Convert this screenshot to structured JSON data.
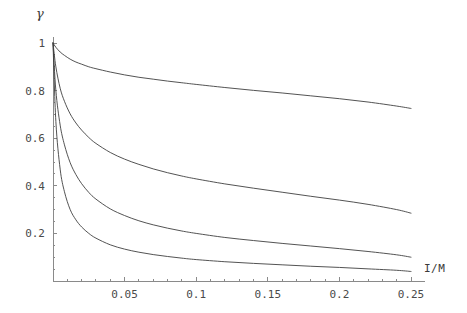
{
  "chart_data": {
    "type": "line",
    "title": "",
    "subtitle": "",
    "xlabel": "I/M",
    "ylabel": "γ",
    "xlim": [
      0,
      0.25
    ],
    "ylim": [
      0,
      1
    ],
    "grid": false,
    "legend": "none",
    "xticks": [
      0.05,
      0.1,
      0.15,
      0.2,
      0.25
    ],
    "xticklabels": [
      "0.05",
      "0.1",
      "0.15",
      "0.2",
      "0.25"
    ],
    "yticks": [
      0.2,
      0.4,
      0.6,
      0.8,
      1
    ],
    "yticklabels": [
      "0.2",
      "0.4",
      "0.6",
      "0.8",
      "1"
    ],
    "x_minor_ticks": [
      0.01,
      0.02,
      0.03,
      0.04,
      0.06,
      0.07,
      0.08,
      0.09,
      0.11,
      0.12,
      0.13,
      0.14,
      0.16,
      0.17,
      0.18,
      0.19,
      0.21,
      0.22,
      0.23,
      0.24
    ],
    "y_minor_ticks": [
      0.05,
      0.1,
      0.15,
      0.25,
      0.3,
      0.35,
      0.45,
      0.5,
      0.55,
      0.65,
      0.7,
      0.75,
      0.85,
      0.9,
      0.95
    ],
    "line_color": "#404040",
    "axis_color": "#8a8a8a",
    "background": "#ffffff",
    "series": [
      {
        "name": "curve-1",
        "x": [
          0.0,
          0.002,
          0.005,
          0.008,
          0.012,
          0.016,
          0.02,
          0.025,
          0.03,
          0.04,
          0.05,
          0.06,
          0.07,
          0.08,
          0.09,
          0.1,
          0.12,
          0.14,
          0.16,
          0.18,
          0.2,
          0.22,
          0.24,
          0.25
        ],
        "y": [
          1.0,
          0.982,
          0.962,
          0.948,
          0.932,
          0.92,
          0.911,
          0.9,
          0.892,
          0.878,
          0.866,
          0.856,
          0.848,
          0.84,
          0.833,
          0.826,
          0.813,
          0.801,
          0.79,
          0.778,
          0.766,
          0.752,
          0.735,
          0.725
        ]
      },
      {
        "name": "curve-2",
        "x": [
          0.0,
          0.002,
          0.005,
          0.008,
          0.012,
          0.016,
          0.02,
          0.025,
          0.03,
          0.04,
          0.05,
          0.06,
          0.07,
          0.08,
          0.09,
          0.1,
          0.12,
          0.14,
          0.16,
          0.18,
          0.2,
          0.22,
          0.24,
          0.25
        ],
        "y": [
          1.0,
          0.9,
          0.81,
          0.755,
          0.702,
          0.664,
          0.634,
          0.603,
          0.578,
          0.54,
          0.512,
          0.49,
          0.471,
          0.455,
          0.441,
          0.429,
          0.408,
          0.39,
          0.373,
          0.356,
          0.34,
          0.322,
          0.3,
          0.285
        ]
      },
      {
        "name": "curve-3",
        "x": [
          0.0,
          0.002,
          0.005,
          0.008,
          0.012,
          0.016,
          0.02,
          0.025,
          0.03,
          0.04,
          0.05,
          0.06,
          0.07,
          0.08,
          0.09,
          0.1,
          0.12,
          0.14,
          0.16,
          0.18,
          0.2,
          0.22,
          0.24,
          0.25
        ],
        "y": [
          1.0,
          0.8,
          0.655,
          0.572,
          0.497,
          0.447,
          0.409,
          0.372,
          0.344,
          0.303,
          0.275,
          0.253,
          0.236,
          0.222,
          0.21,
          0.2,
          0.183,
          0.17,
          0.158,
          0.147,
          0.136,
          0.124,
          0.11,
          0.1
        ]
      },
      {
        "name": "curve-4",
        "x": [
          0.0,
          0.002,
          0.005,
          0.008,
          0.012,
          0.016,
          0.02,
          0.025,
          0.03,
          0.04,
          0.05,
          0.06,
          0.07,
          0.08,
          0.09,
          0.1,
          0.12,
          0.14,
          0.16,
          0.18,
          0.2,
          0.22,
          0.24,
          0.25
        ],
        "y": [
          1.0,
          0.67,
          0.47,
          0.375,
          0.3,
          0.257,
          0.227,
          0.2,
          0.18,
          0.152,
          0.134,
          0.121,
          0.111,
          0.103,
          0.096,
          0.09,
          0.081,
          0.074,
          0.068,
          0.062,
          0.057,
          0.051,
          0.045,
          0.04
        ]
      }
    ]
  },
  "geometry": {
    "plot_left": 53,
    "plot_right": 411,
    "plot_bottom": 281,
    "plot_top": 43,
    "tick_len_major": 4,
    "tick_len_minor": 2
  }
}
